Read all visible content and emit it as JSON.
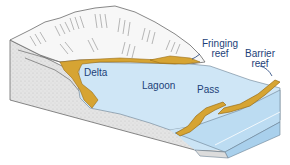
{
  "diagram": {
    "labels": {
      "delta": "Delta",
      "lagoon": "Lagoon",
      "pass": "Pass",
      "fringing_reef_line1": "Fringing",
      "fringing_reef_line2": "reef",
      "barrier_reef_line1": "Barrier",
      "barrier_reef_line2": "reef"
    },
    "colors": {
      "water": "#cfe6f6",
      "water_side": "#bcdcf2",
      "reef": "#d6a433",
      "reef_dark": "#9a6d15",
      "land": "#f4f4f4",
      "rock": "#dedede",
      "line": "#555555",
      "label_text": "#1d3f78"
    }
  }
}
